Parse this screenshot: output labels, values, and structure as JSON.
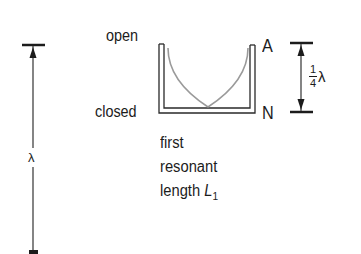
{
  "diagram": {
    "type": "physics-resonance-tube",
    "labels": {
      "open": "open",
      "closed": "closed",
      "antinode": "A",
      "node": "N",
      "wavelength": "λ",
      "quarter_numerator": "1",
      "quarter_denominator": "4",
      "quarter_symbol": "λ"
    },
    "caption": {
      "line1": "first",
      "line2": "resonant",
      "line3_text": "length ",
      "line3_var": "L",
      "line3_sub": "1"
    },
    "colors": {
      "ink": "#1c1c1c",
      "wave": "#9a9a9a",
      "background": "#ffffff"
    }
  }
}
